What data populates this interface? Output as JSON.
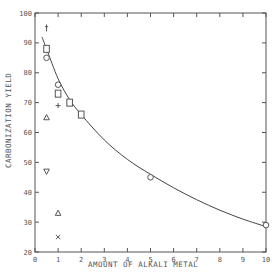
{
  "chart_data": {
    "type": "scatter",
    "title": "",
    "xlabel": "AMOUNT OF ALKALI METAL",
    "ylabel": "CARBONIZATION YIELD",
    "xlim": [
      0,
      10
    ],
    "ylim": [
      20,
      100
    ],
    "x_ticks": [
      0,
      1,
      2,
      3,
      4,
      5,
      6,
      7,
      8,
      9,
      10
    ],
    "y_ticks": [
      20,
      30,
      40,
      50,
      60,
      70,
      80,
      90,
      100
    ],
    "grid": false,
    "legend": "none",
    "series": [
      {
        "name": "circle",
        "marker": "o",
        "points": [
          [
            0.5,
            85
          ],
          [
            1,
            76
          ],
          [
            5,
            45
          ],
          [
            10,
            29
          ]
        ]
      },
      {
        "name": "square",
        "marker": "square",
        "points": [
          [
            0.5,
            88
          ],
          [
            1,
            73
          ],
          [
            1.5,
            70
          ],
          [
            2,
            66
          ]
        ]
      },
      {
        "name": "dagger",
        "marker": "dagger",
        "points": [
          [
            0.5,
            95
          ]
        ]
      },
      {
        "name": "plus",
        "marker": "+",
        "points": [
          [
            1,
            69
          ]
        ]
      },
      {
        "name": "triangle-up",
        "marker": "triangle-up",
        "points": [
          [
            0.5,
            65
          ],
          [
            1,
            33
          ]
        ]
      },
      {
        "name": "triangle-down",
        "marker": "triangle-down",
        "points": [
          [
            0.5,
            47
          ]
        ]
      },
      {
        "name": "cross",
        "marker": "x",
        "points": [
          [
            1,
            25
          ]
        ]
      }
    ],
    "fit_curve": {
      "name": "trend",
      "points": [
        [
          0.3,
          92
        ],
        [
          0.5,
          88
        ],
        [
          1,
          78
        ],
        [
          1.5,
          71
        ],
        [
          2,
          66
        ],
        [
          3,
          57.5
        ],
        [
          4,
          51
        ],
        [
          5,
          46
        ],
        [
          6,
          41.5
        ],
        [
          7,
          37.5
        ],
        [
          8,
          34
        ],
        [
          9,
          31
        ],
        [
          10,
          28.5
        ]
      ]
    }
  },
  "axes": {
    "xlabel": "AMOUNT OF ALKALI METAL",
    "ylabel": "CARBONIZATION YIELD"
  }
}
